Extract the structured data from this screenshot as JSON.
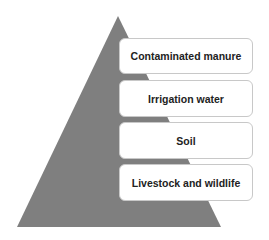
{
  "diagram": {
    "type": "pyramid",
    "colors": {
      "pyramid": "#7f7f7f",
      "box_border": "#c8c8c8",
      "box_fill": "#ffffff"
    },
    "levels": [
      {
        "label": "Contaminated manure"
      },
      {
        "label": "Irrigation water"
      },
      {
        "label": "Soil"
      },
      {
        "label": "Livestock and wildlife"
      }
    ]
  }
}
